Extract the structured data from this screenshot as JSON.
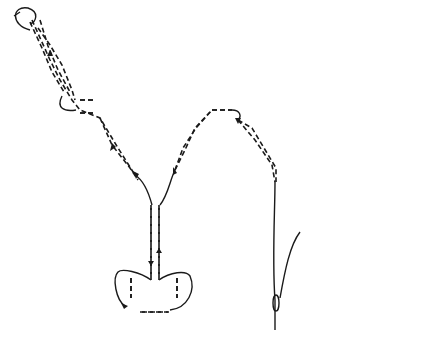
{
  "figure": {
    "label": "38",
    "colors": {
      "outline": "#1a1a1a",
      "shaded_bead": "#d4d4d4",
      "plain_bead": "#ffffff",
      "background": "#ffffff"
    }
  },
  "beads": {
    "top_row": [
      {
        "cx": 34,
        "cy": 25
      },
      {
        "cx": 68,
        "cy": 25
      },
      {
        "cx": 102,
        "cy": 25
      },
      {
        "cx": 136,
        "cy": 25
      },
      {
        "cx": 170,
        "cy": 25
      },
      {
        "cx": 204,
        "cy": 25
      },
      {
        "cx": 238,
        "cy": 25
      },
      {
        "cx": 272,
        "cy": 25
      },
      {
        "cx": 306,
        "cy": 25
      },
      {
        "cx": 340,
        "cy": 25
      },
      {
        "cx": 374,
        "cy": 25
      },
      {
        "cx": 408,
        "cy": 25
      }
    ],
    "shaded": [
      {
        "cx": 45,
        "cy": 47
      },
      {
        "cx": 55,
        "cy": 68
      },
      {
        "cx": 70,
        "cy": 89
      },
      {
        "cx": 123,
        "cy": 47
      },
      {
        "cx": 117,
        "cy": 68
      },
      {
        "cx": 105,
        "cy": 89
      },
      {
        "cx": 180,
        "cy": 47
      },
      {
        "cx": 188,
        "cy": 68
      },
      {
        "cx": 199,
        "cy": 89
      },
      {
        "cx": 258,
        "cy": 47
      },
      {
        "cx": 253,
        "cy": 68
      },
      {
        "cx": 245,
        "cy": 89
      },
      {
        "cx": 323,
        "cy": 47
      },
      {
        "cx": 330,
        "cy": 68
      },
      {
        "cx": 342,
        "cy": 89
      },
      {
        "cx": 395,
        "cy": 47
      },
      {
        "cx": 392,
        "cy": 68
      },
      {
        "cx": 382,
        "cy": 89
      }
    ],
    "shaded_vertical": [
      {
        "cx": 88,
        "cy": 107
      },
      {
        "cx": 221,
        "cy": 107
      },
      {
        "cx": 357,
        "cy": 107
      }
    ],
    "plain": [
      {
        "cx": 103,
        "cy": 127
      },
      {
        "cx": 117,
        "cy": 147
      },
      {
        "cx": 133,
        "cy": 167
      },
      {
        "cx": 193,
        "cy": 127
      },
      {
        "cx": 180,
        "cy": 147
      },
      {
        "cx": 170,
        "cy": 167
      },
      {
        "cx": 250,
        "cy": 127
      },
      {
        "cx": 264,
        "cy": 147
      },
      {
        "cx": 280,
        "cy": 167
      },
      {
        "cx": 340,
        "cy": 127
      },
      {
        "cx": 330,
        "cy": 147
      },
      {
        "cx": 317,
        "cy": 167
      }
    ],
    "plain_vertical": [
      {
        "cx": 155,
        "cy": 187
      },
      {
        "cx": 295,
        "cy": 187
      }
    ],
    "pendant_stack": [
      {
        "cx": 155,
        "cy": 220
      },
      {
        "cx": 155,
        "cy": 245
      },
      {
        "cx": 155,
        "cy": 268
      }
    ],
    "pendant_side": [
      {
        "cx": 131,
        "cy": 287
      },
      {
        "cx": 177,
        "cy": 287
      }
    ],
    "pendant_bottom": {
      "cx": 155,
      "cy": 312
    }
  }
}
